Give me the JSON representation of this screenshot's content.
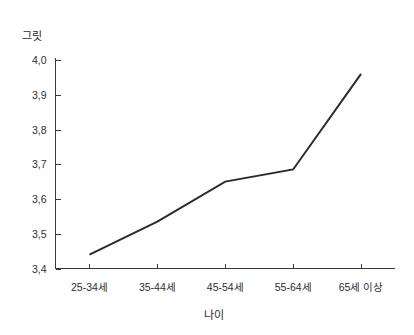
{
  "chart_data": {
    "type": "line",
    "title": "",
    "subtitle": "",
    "xlabel": "나이",
    "ylabel": "그릿",
    "categories": [
      "25-34세",
      "35-44세",
      "45-54세",
      "55-64세",
      "65세 이상"
    ],
    "series": [
      {
        "name": "그릿",
        "values": [
          3.44,
          3.535,
          3.65,
          3.685,
          3.96
        ],
        "color": "#2b2b2b"
      }
    ],
    "ylim": [
      3.4,
      4.0
    ],
    "y_ticks": [
      3.4,
      3.5,
      3.6,
      3.7,
      3.8,
      3.9,
      4.0
    ],
    "y_tick_labels": [
      "3,4",
      "3,5",
      "3,6",
      "3,7",
      "3,8",
      "3,9",
      "4,0"
    ],
    "x_tick_labels": [
      "25-34세",
      "35-44세",
      "45-54세",
      "55-64세",
      "65세 이상"
    ],
    "grid": false,
    "legend": false,
    "legend_position": "none",
    "axis_color": "#3a3a3a",
    "background_color": "#ffffff"
  },
  "figure": {
    "y_axis_title": "그릿",
    "x_axis_title": "나이"
  }
}
